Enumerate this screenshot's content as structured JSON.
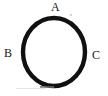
{
  "figure": {
    "kind": "circle-diagram",
    "caption": "",
    "background_color": "#ffffff",
    "stroke_color": "#111111",
    "label_color": "#171717",
    "circle": {
      "center_x": 54,
      "center_y": 52,
      "radius_x": 31,
      "radius_y": 34,
      "stroke_width": 4
    },
    "labels": {
      "top": "A",
      "left": "B",
      "right": "C"
    },
    "artifacts": {
      "bottom_smudge": "",
      "bottom_dash": "",
      "corner_dot": ""
    }
  }
}
